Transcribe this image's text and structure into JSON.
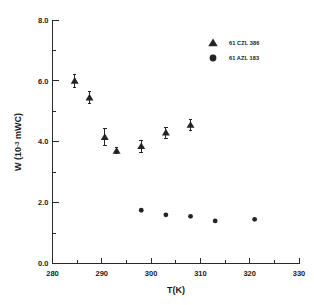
{
  "chart_data": {
    "type": "scatter",
    "title": "",
    "xlabel": "T(K)",
    "ylabel": "W (10-3 mWC)",
    "ylabel_prefix": "W (10",
    "ylabel_exponent": "-3",
    "ylabel_suffix": " mWC)",
    "xlim": [
      280,
      330
    ],
    "ylim": [
      0.0,
      8.0
    ],
    "xticks": [
      280,
      290,
      300,
      310,
      320,
      330
    ],
    "xtick_labels": [
      "280",
      "290",
      "300",
      "310",
      "320",
      "330"
    ],
    "xticks_minor": [
      285,
      295,
      305,
      315,
      325
    ],
    "yticks": [
      0.0,
      2.0,
      4.0,
      6.0,
      8.0
    ],
    "ytick_labels": [
      "0.0",
      "2.0",
      "4.0",
      "6.0",
      "8.0"
    ],
    "yticks_minor": [
      1.0,
      3.0,
      5.0,
      7.0
    ],
    "grid": false,
    "legend_position": "top-right",
    "series": [
      {
        "name": "61 CZL 386",
        "marker": "triangle",
        "color": "#242424",
        "points": [
          {
            "x": 284.5,
            "y": 6.0,
            "yerr": 0.22
          },
          {
            "x": 287.5,
            "y": 5.45,
            "yerr": 0.2
          },
          {
            "x": 290.6,
            "y": 4.15,
            "yerr": 0.28
          },
          {
            "x": 293.0,
            "y": 3.7,
            "yerr": 0.1
          },
          {
            "x": 298.0,
            "y": 3.85,
            "yerr": 0.2
          },
          {
            "x": 303.0,
            "y": 4.3,
            "yerr": 0.18
          },
          {
            "x": 308.0,
            "y": 4.55,
            "yerr": 0.18
          }
        ]
      },
      {
        "name": "61 AZL 183",
        "marker": "circle",
        "color": "#242424",
        "points": [
          {
            "x": 298.0,
            "y": 1.75,
            "yerr": 0
          },
          {
            "x": 303.0,
            "y": 1.6,
            "yerr": 0
          },
          {
            "x": 308.0,
            "y": 1.55,
            "yerr": 0
          },
          {
            "x": 313.0,
            "y": 1.4,
            "yerr": 0
          },
          {
            "x": 321.0,
            "y": 1.45,
            "yerr": 0
          }
        ]
      }
    ]
  },
  "legend": {
    "entries": [
      {
        "marker": "triangle",
        "label": "61 CZL 386"
      },
      {
        "marker": "circle",
        "label": "61 AZL 183"
      }
    ]
  }
}
